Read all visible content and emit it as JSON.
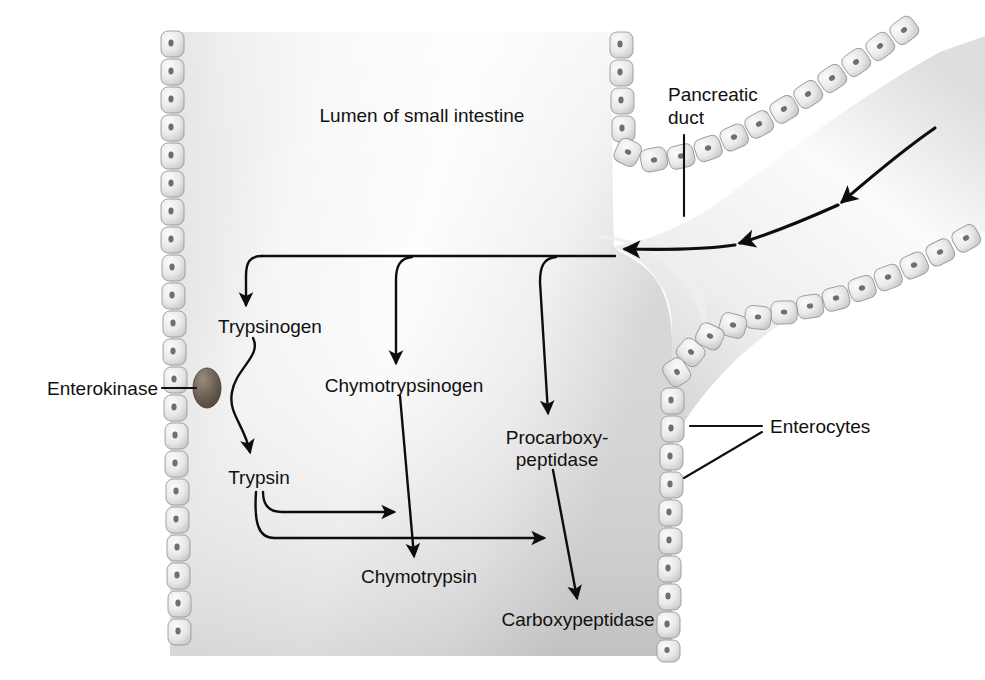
{
  "figure": {
    "type": "biological-diagram",
    "background_color": "#ffffff",
    "ink_color": "#111111",
    "tissue_fill_light": "#fdfdfd",
    "tissue_fill_mid": "#e2e2e2",
    "tissue_fill_dark": "#c2c2c2",
    "cell_fill": "#e8e8e8",
    "cell_stroke": "#9a9a9a",
    "nucleus_color": "#6f6f6f",
    "enterokinase_color": "#6b5f55"
  },
  "labels": {
    "lumen": "Lumen of small intestine",
    "pancreatic_duct_line1": "Pancreatic",
    "pancreatic_duct_line2": "duct",
    "enterocytes": "Enterocytes",
    "enterokinase": "Enterokinase"
  },
  "pathway": {
    "nodes": [
      {
        "id": "trypsinogen",
        "label": "Trypsinogen",
        "x": 270,
        "y": 326,
        "anchor": "middle"
      },
      {
        "id": "chymotrypsinogen",
        "label": "Chymotrypsinogen",
        "x": 404,
        "y": 385,
        "anchor": "middle"
      },
      {
        "id": "procarboxypeptidase",
        "label": "Procarboxy-",
        "x": 557,
        "y": 437,
        "anchor": "middle"
      },
      {
        "id": "procarboxypeptidase2",
        "label": "peptidase",
        "x": 557,
        "y": 459,
        "anchor": "middle"
      },
      {
        "id": "trypsin",
        "label": "Trypsin",
        "x": 259,
        "y": 477,
        "anchor": "middle"
      },
      {
        "id": "chymotrypsin",
        "label": "Chymotrypsin",
        "x": 419,
        "y": 576,
        "anchor": "middle"
      },
      {
        "id": "carboxypeptidase",
        "label": "Carboxypeptidase",
        "x": 578,
        "y": 619,
        "anchor": "middle"
      }
    ],
    "conversions": [
      {
        "from": "trypsinogen",
        "to": "trypsin",
        "catalyst": "enterokinase"
      },
      {
        "from": "chymotrypsinogen",
        "to": "chymotrypsin",
        "catalyst": "trypsin"
      },
      {
        "from": "procarboxypeptidase",
        "to": "carboxypeptidase",
        "catalyst": "trypsin"
      }
    ],
    "secreted_from": "pancreatic duct",
    "branch_targets": [
      "trypsinogen",
      "chymotrypsinogen",
      "procarboxypeptidase"
    ]
  },
  "flow_arrows": {
    "count": 3,
    "direction": "right-to-left (duct into lumen)"
  }
}
